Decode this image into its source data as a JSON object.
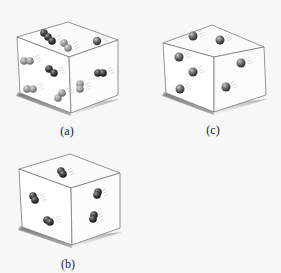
{
  "figure": {
    "background": "#f7f7f7",
    "panels": [
      {
        "id": "a",
        "label": "(a)",
        "description": "Cube containing mixture of diatomic molecules (dark) and atoms in pairs (light)",
        "label_pos": [
          67,
          124
        ],
        "cube": {
          "tl": [
            17,
            37
          ],
          "tb": [
            68,
            22
          ],
          "tr": [
            118,
            40
          ],
          "ft": [
            69,
            57
          ],
          "fb": [
            71,
            113
          ],
          "lb": [
            20,
            93
          ],
          "rb": [
            118,
            95
          ]
        },
        "particles": [
          {
            "type": "dark-pair",
            "x": [
              44,
              48,
              52
            ],
            "y": [
              33,
              37,
              41
            ]
          },
          {
            "type": "light-pair",
            "x": [
              64,
              68
            ],
            "y": [
              43,
              48
            ]
          },
          {
            "type": "dark-single",
            "x": [
              97
            ],
            "y": [
              41
            ]
          },
          {
            "type": "light-pair",
            "x": [
              24,
              30
            ],
            "y": [
              61,
              61
            ]
          },
          {
            "type": "dark-pair",
            "x": [
              49,
              54
            ],
            "y": [
              69,
              73
            ]
          },
          {
            "type": "dark-pair",
            "x": [
              98,
              103
            ],
            "y": [
              73,
              73
            ]
          },
          {
            "type": "light-pair",
            "x": [
              27,
              33
            ],
            "y": [
              89,
              89
            ]
          },
          {
            "type": "light-pair",
            "x": [
              58,
              62
            ],
            "y": [
              98,
              93
            ]
          },
          {
            "type": "light-pair",
            "x": [
              80,
              80
            ],
            "y": [
              84,
              89
            ]
          }
        ]
      },
      {
        "id": "c",
        "label": "(c)",
        "description": "Cube containing single atoms (spheres)",
        "label_pos": [
          213,
          123
        ],
        "cube": {
          "tl": [
            163,
            43
          ],
          "tb": [
            212,
            25
          ],
          "tr": [
            264,
            47
          ],
          "ft": [
            214,
            57
          ],
          "fb": [
            214,
            112
          ],
          "lb": [
            166,
            93
          ],
          "rb": [
            266,
            95
          ]
        },
        "particles": [
          {
            "type": "sphere",
            "x": [
              193
            ],
            "y": [
              36
            ]
          },
          {
            "type": "sphere",
            "x": [
              220
            ],
            "y": [
              40
            ]
          },
          {
            "type": "sphere",
            "x": [
              179
            ],
            "y": [
              57
            ]
          },
          {
            "type": "sphere",
            "x": [
              193
            ],
            "y": [
              72
            ]
          },
          {
            "type": "sphere",
            "x": [
              180
            ],
            "y": [
              89
            ]
          },
          {
            "type": "sphere",
            "x": [
              241
            ],
            "y": [
              63
            ]
          },
          {
            "type": "sphere",
            "x": [
              226
            ],
            "y": [
              87
            ]
          }
        ]
      },
      {
        "id": "b",
        "label": "(b)",
        "description": "Cube containing diatomic molecules only",
        "label_pos": [
          68,
          257
        ],
        "cube": {
          "tl": [
            19,
            169
          ],
          "tb": [
            70,
            154
          ],
          "tr": [
            120,
            173
          ],
          "ft": [
            71,
            188
          ],
          "fb": [
            72,
            245
          ],
          "lb": [
            22,
            227
          ],
          "rb": [
            120,
            228
          ]
        },
        "particles": [
          {
            "type": "dark-pair",
            "x": [
              61,
              63
            ],
            "y": [
              171,
              174
            ]
          },
          {
            "type": "dark-pair",
            "x": [
              33,
              35
            ],
            "y": [
              196,
              200
            ]
          },
          {
            "type": "dark-pair",
            "x": [
              47,
              50
            ],
            "y": [
              220,
              222
            ]
          },
          {
            "type": "dark-pair",
            "x": [
              98,
              97
            ],
            "y": [
              192,
              195
            ]
          },
          {
            "type": "dark-pair",
            "x": [
              94,
              93
            ],
            "y": [
              215,
              219
            ]
          }
        ]
      }
    ]
  }
}
